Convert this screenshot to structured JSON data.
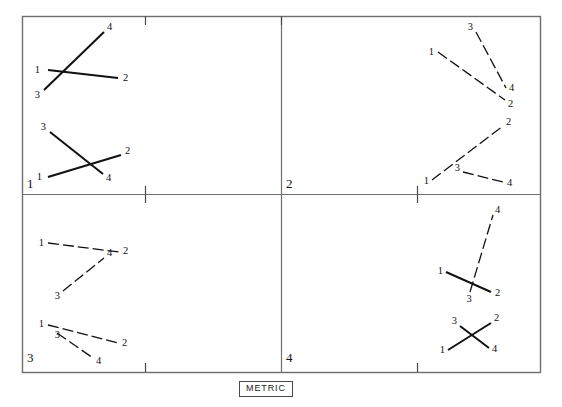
{
  "figure": {
    "caption": "METRIC",
    "frame": {
      "stroke": "#6e6e6e",
      "x": 22,
      "y": 16,
      "width": 518,
      "height": 356
    },
    "divider": {
      "vertical_x": 281,
      "horizontal_y": 194
    },
    "ticks": [
      {
        "name": "top-tick",
        "x": 145,
        "y": 16,
        "dx": 0,
        "dy": 9
      },
      {
        "name": "center-top-tick",
        "x": 281,
        "y": 16,
        "dx": 0,
        "dy": 9
      },
      {
        "name": "mid-left-tick",
        "x": 145,
        "y": 186,
        "dx": 0,
        "dy": 17
      },
      {
        "name": "mid-right-tick",
        "x": 417,
        "y": 186,
        "dx": 0,
        "dy": 17
      },
      {
        "name": "bottom-left-tick",
        "x": 145,
        "y": 363,
        "dx": 0,
        "dy": 9
      },
      {
        "name": "bottom-right-tick",
        "x": 417,
        "y": 363,
        "dx": 0,
        "dy": 9
      }
    ],
    "panels": [
      {
        "id": "panel-1",
        "number": "1",
        "number_pos": {
          "x": 27,
          "y": 188
        },
        "figures": [
          {
            "id": "p1-fig-a",
            "segments": [
              {
                "name": "segment-1-2",
                "style": "solid",
                "x1": 48,
                "y1": 70,
                "x2": 118,
                "y2": 78
              },
              {
                "name": "segment-3-4",
                "style": "solid",
                "x1": 44,
                "y1": 90,
                "x2": 104,
                "y2": 32
              }
            ],
            "labels": [
              {
                "text": "1",
                "x": 40,
                "y": 73,
                "anchor": "end"
              },
              {
                "text": "2",
                "x": 123,
                "y": 81,
                "anchor": "start"
              },
              {
                "text": "3",
                "x": 40,
                "y": 98,
                "anchor": "end"
              },
              {
                "text": "4",
                "x": 107,
                "y": 30,
                "anchor": "start"
              }
            ]
          },
          {
            "id": "p1-fig-b",
            "segments": [
              {
                "name": "segment-1-2",
                "style": "solid",
                "x1": 48,
                "y1": 177,
                "x2": 121,
                "y2": 155
              },
              {
                "name": "segment-3-4",
                "style": "solid",
                "x1": 50,
                "y1": 132,
                "x2": 103,
                "y2": 174
              }
            ],
            "labels": [
              {
                "text": "1",
                "x": 42,
                "y": 180,
                "anchor": "end"
              },
              {
                "text": "2",
                "x": 125,
                "y": 154,
                "anchor": "start"
              },
              {
                "text": "3",
                "x": 46,
                "y": 130,
                "anchor": "end"
              },
              {
                "text": "4",
                "x": 106,
                "y": 181,
                "anchor": "start"
              }
            ]
          }
        ]
      },
      {
        "id": "panel-2",
        "number": "2",
        "number_pos": {
          "x": 286,
          "y": 188
        },
        "figures": [
          {
            "id": "p2-fig-a",
            "segments": [
              {
                "name": "segment-1-2",
                "style": "dashed",
                "x1": 438,
                "y1": 52,
                "x2": 505,
                "y2": 100
              },
              {
                "name": "segment-3-4",
                "style": "dashed",
                "x1": 476,
                "y1": 32,
                "x2": 506,
                "y2": 88
              }
            ],
            "labels": [
              {
                "text": "1",
                "x": 434,
                "y": 55,
                "anchor": "end"
              },
              {
                "text": "2",
                "x": 508,
                "y": 107,
                "anchor": "start"
              },
              {
                "text": "3",
                "x": 473,
                "y": 30,
                "anchor": "end"
              },
              {
                "text": "4",
                "x": 509,
                "y": 91,
                "anchor": "start"
              }
            ]
          },
          {
            "id": "p2-fig-b",
            "segments": [
              {
                "name": "segment-1-2",
                "style": "dashed",
                "x1": 432,
                "y1": 180,
                "x2": 503,
                "y2": 126
              },
              {
                "name": "segment-3-4",
                "style": "dashed",
                "x1": 463,
                "y1": 172,
                "x2": 503,
                "y2": 182
              }
            ],
            "labels": [
              {
                "text": "1",
                "x": 429,
                "y": 184,
                "anchor": "end"
              },
              {
                "text": "2",
                "x": 506,
                "y": 125,
                "anchor": "start"
              },
              {
                "text": "3",
                "x": 460,
                "y": 171,
                "anchor": "end"
              },
              {
                "text": "4",
                "x": 507,
                "y": 186,
                "anchor": "start"
              }
            ]
          }
        ]
      },
      {
        "id": "panel-3",
        "number": "3",
        "number_pos": {
          "x": 27,
          "y": 362
        },
        "figures": [
          {
            "id": "p3-fig-a",
            "segments": [
              {
                "name": "segment-1-2",
                "style": "dashed",
                "x1": 48,
                "y1": 243,
                "x2": 119,
                "y2": 252
              },
              {
                "name": "segment-3-4",
                "style": "dashed",
                "x1": 63,
                "y1": 291,
                "x2": 104,
                "y2": 258
              }
            ],
            "labels": [
              {
                "text": "1",
                "x": 44,
                "y": 246,
                "anchor": "end"
              },
              {
                "text": "2",
                "x": 123,
                "y": 254,
                "anchor": "start"
              },
              {
                "text": "3",
                "x": 60,
                "y": 299,
                "anchor": "end"
              },
              {
                "text": "4",
                "x": 107,
                "y": 256,
                "anchor": "start"
              }
            ]
          },
          {
            "id": "p3-fig-b",
            "segments": [
              {
                "name": "segment-1-2",
                "style": "dashed",
                "x1": 48,
                "y1": 325,
                "x2": 118,
                "y2": 343
              },
              {
                "name": "segment-3-4",
                "style": "dashed",
                "x1": 57,
                "y1": 333,
                "x2": 93,
                "y2": 358
              }
            ],
            "labels": [
              {
                "text": "1",
                "x": 44,
                "y": 327,
                "anchor": "end"
              },
              {
                "text": "2",
                "x": 122,
                "y": 346,
                "anchor": "start"
              },
              {
                "text": "3",
                "x": 60,
                "y": 338,
                "anchor": "end"
              },
              {
                "text": "4",
                "x": 96,
                "y": 364,
                "anchor": "start"
              }
            ]
          }
        ]
      },
      {
        "id": "panel-4",
        "number": "4",
        "number_pos": {
          "x": 286,
          "y": 362
        },
        "figures": [
          {
            "id": "p4-fig-a",
            "segments": [
              {
                "name": "segment-1-2",
                "style": "solid",
                "x1": 446,
                "y1": 272,
                "x2": 491,
                "y2": 292
              },
              {
                "name": "segment-3-4",
                "style": "dashed",
                "x1": 470,
                "y1": 292,
                "x2": 493,
                "y2": 215
              }
            ],
            "labels": [
              {
                "text": "1",
                "x": 443,
                "y": 274,
                "anchor": "end"
              },
              {
                "text": "2",
                "x": 495,
                "y": 296,
                "anchor": "start"
              },
              {
                "text": "3",
                "x": 469,
                "y": 302,
                "anchor": "middle"
              },
              {
                "text": "4",
                "x": 495,
                "y": 213,
                "anchor": "start"
              }
            ]
          },
          {
            "id": "p4-fig-b",
            "segments": [
              {
                "name": "segment-1-2",
                "style": "solid",
                "x1": 448,
                "y1": 350,
                "x2": 491,
                "y2": 323
              },
              {
                "name": "segment-3-4",
                "style": "solid",
                "x1": 460,
                "y1": 326,
                "x2": 489,
                "y2": 348
              }
            ],
            "labels": [
              {
                "text": "1",
                "x": 445,
                "y": 353,
                "anchor": "end"
              },
              {
                "text": "2",
                "x": 494,
                "y": 321,
                "anchor": "start"
              },
              {
                "text": "3",
                "x": 457,
                "y": 324,
                "anchor": "end"
              },
              {
                "text": "4",
                "x": 492,
                "y": 352,
                "anchor": "start"
              }
            ]
          }
        ]
      }
    ]
  }
}
